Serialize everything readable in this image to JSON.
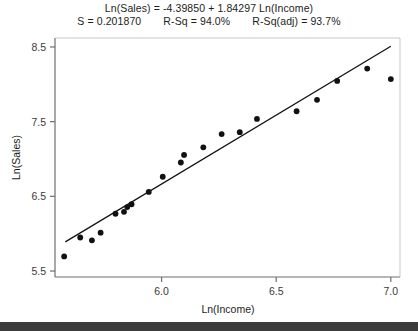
{
  "chart_data": {
    "type": "scatter",
    "title": "Ln(Sales) = -4.39850 + 1.84297 Ln(Income)",
    "subtitle_stats": {
      "s_label": "S = 0.201870",
      "rsq_label": "R-Sq = 94.0%",
      "rsq_adj_label": "R-Sq(adj) = 93.7%",
      "s": 0.20187,
      "r_sq": 94.0,
      "r_sq_adj": 93.7
    },
    "xlabel": "Ln(Income)",
    "ylabel": "Ln(Sales)",
    "xlim": [
      5.535,
      7.04
    ],
    "ylim": [
      5.42,
      8.62
    ],
    "xticks": [
      6.0,
      6.5,
      7.0
    ],
    "xtick_labels": [
      "6.0",
      "6.5",
      "7.0"
    ],
    "yticks": [
      5.5,
      6.5,
      7.5,
      8.5
    ],
    "ytick_labels": [
      "5.5",
      "6.5",
      "7.5",
      "8.5"
    ],
    "grid": false,
    "legend": "none",
    "marker": "filled-circle",
    "marker_color": "#111111",
    "fit_line_color": "#111111",
    "fit": {
      "type": "linear",
      "intercept": -4.3985,
      "slope": 1.84297,
      "x_start": 5.58,
      "x_end": 7.0,
      "y_start": 5.89,
      "y_end": 8.51
    },
    "points": [
      {
        "x": 5.575,
        "y": 5.695
      },
      {
        "x": 5.645,
        "y": 5.949
      },
      {
        "x": 5.696,
        "y": 5.911
      },
      {
        "x": 5.734,
        "y": 6.013
      },
      {
        "x": 5.799,
        "y": 6.267
      },
      {
        "x": 5.836,
        "y": 6.292
      },
      {
        "x": 5.85,
        "y": 6.356
      },
      {
        "x": 5.869,
        "y": 6.394
      },
      {
        "x": 5.944,
        "y": 6.559
      },
      {
        "x": 6.005,
        "y": 6.762
      },
      {
        "x": 6.098,
        "y": 7.055
      },
      {
        "x": 6.084,
        "y": 6.953
      },
      {
        "x": 6.182,
        "y": 7.156
      },
      {
        "x": 6.262,
        "y": 7.334
      },
      {
        "x": 6.341,
        "y": 7.359
      },
      {
        "x": 6.416,
        "y": 7.537
      },
      {
        "x": 6.589,
        "y": 7.639
      },
      {
        "x": 6.678,
        "y": 7.792
      },
      {
        "x": 6.766,
        "y": 8.045
      },
      {
        "x": 6.897,
        "y": 8.21
      },
      {
        "x": 7.0,
        "y": 8.07
      }
    ]
  },
  "figure": {
    "axis_color": "#6e6e6e",
    "background": "#ffffff",
    "footer_bar_color": "#3c3c3c"
  }
}
